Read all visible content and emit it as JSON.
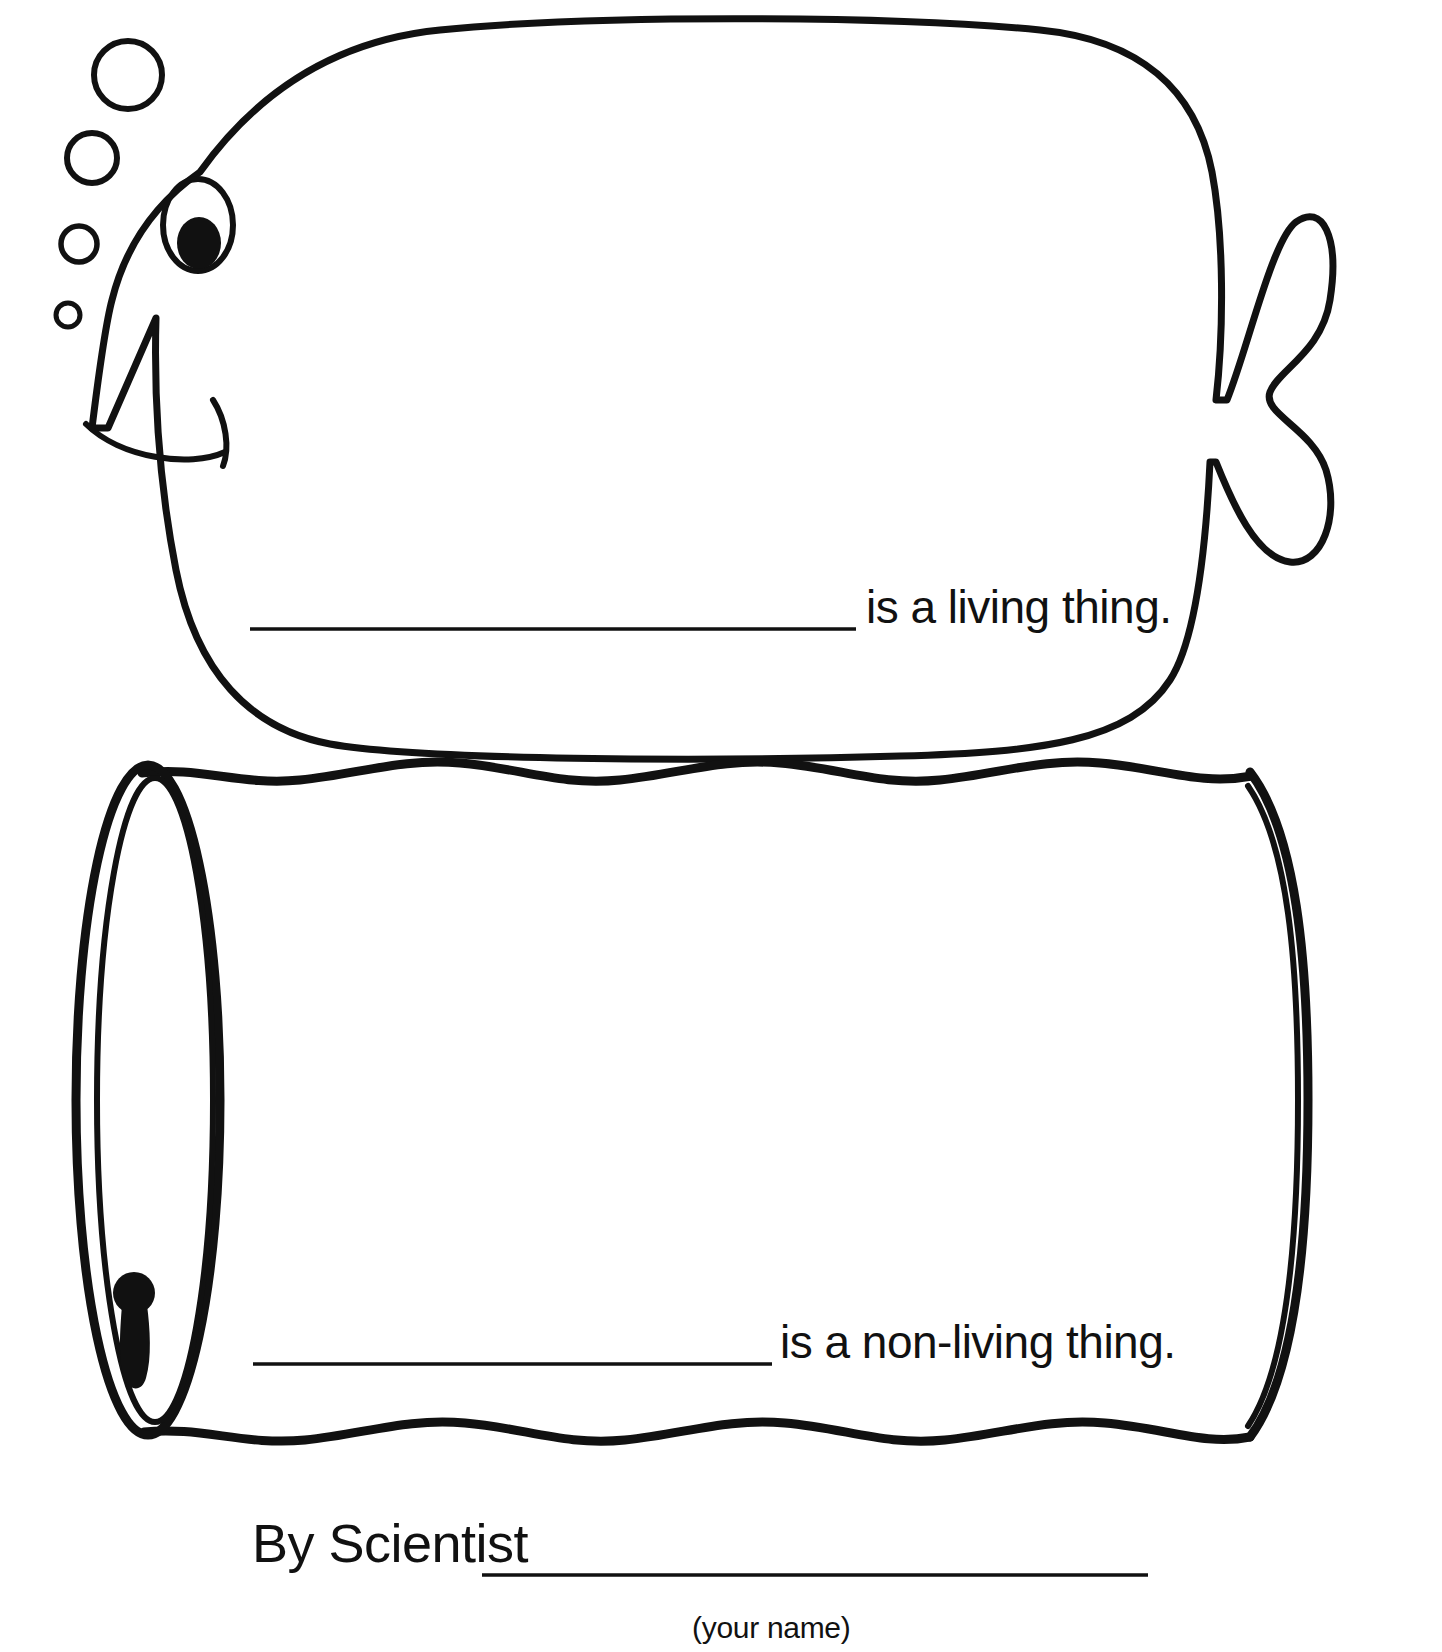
{
  "page": {
    "background_color": "#ffffff",
    "ink_color": "#111111"
  },
  "living_panel": {
    "name": "fish-drawing-panel",
    "illustration": "fish",
    "illustration_parts": [
      "fish-body",
      "fish-eye",
      "fish-pupil",
      "fish-mouth",
      "fish-tail",
      "bubble-1",
      "bubble-2",
      "bubble-3",
      "bubble-4"
    ],
    "bubble_count": 4,
    "blank_line_label": "write-answer-blank",
    "caption": "is a living thing."
  },
  "nonliving_panel": {
    "name": "can-drawing-panel",
    "illustration": "tin-can",
    "illustration_parts": [
      "can-body",
      "can-left-rim-outer",
      "can-left-rim-inner",
      "can-right-rim",
      "can-keyhole-punch"
    ],
    "blank_line_label": "write-answer-blank",
    "caption": "is a non-living thing."
  },
  "signature": {
    "label": "By Scientist",
    "blank_line_label": "student-name-blank",
    "hint": "(your name)"
  }
}
